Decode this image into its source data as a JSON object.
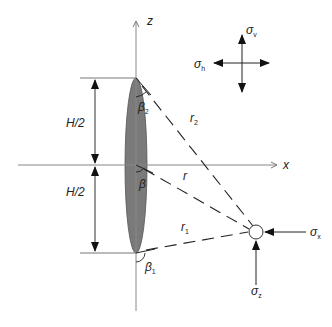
{
  "diagram": {
    "type": "physics-schematic",
    "axes": {
      "vertical_label": "z",
      "horizontal_label": "x"
    },
    "dimensions": {
      "upper_half_label": "H/2",
      "lower_half_label": "H/2"
    },
    "fracture": {
      "fill_color": "#7a7a7a",
      "outline_color": "#555555"
    },
    "distances": {
      "top_tip": "r",
      "top_tip_sub": "2",
      "center": "r",
      "bottom_tip": "r",
      "bottom_tip_sub": "1"
    },
    "angles": {
      "top": "β",
      "top_sub": "2",
      "center": "β",
      "bottom": "β",
      "bottom_sub": "1"
    },
    "far_field_stresses": {
      "vertical": "σ",
      "vertical_sub": "v",
      "horizontal": "σ",
      "horizontal_sub": "h"
    },
    "point_stresses": {
      "x_component": "σ",
      "x_sub": "x",
      "z_component": "σ",
      "z_sub": "z"
    },
    "line_color": "#333333",
    "axis_color": "#888888"
  }
}
